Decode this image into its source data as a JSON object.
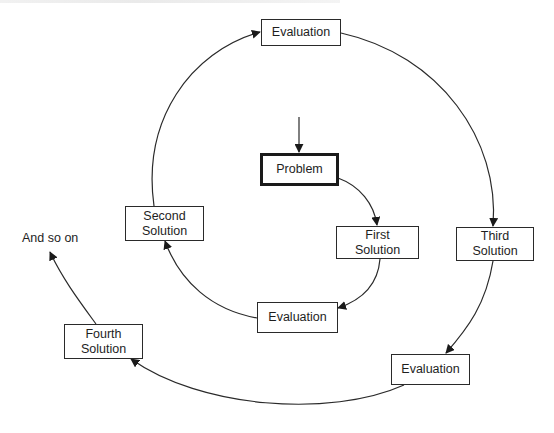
{
  "diagram": {
    "type": "spiral-flow",
    "nodes": [
      {
        "id": "problem",
        "label": "Problem",
        "emphasis": "thick-border"
      },
      {
        "id": "first_solution",
        "label": "First\nSolution",
        "line1": "First",
        "line2": "Solution"
      },
      {
        "id": "evaluation_1",
        "label": "Evaluation"
      },
      {
        "id": "second_solution",
        "label": "Second\nSolution",
        "line1": "Second",
        "line2": "Solution"
      },
      {
        "id": "evaluation_2",
        "label": "Evaluation"
      },
      {
        "id": "third_solution",
        "label": "Third\nSolution",
        "line1": "Third",
        "line2": "Solution"
      },
      {
        "id": "evaluation_3",
        "label": "Evaluation"
      },
      {
        "id": "fourth_solution",
        "label": "Fourth\nSolution",
        "line1": "Fourth",
        "line2": "Solution"
      }
    ],
    "continuation_label": "And so on",
    "edges": [
      [
        "entry",
        "problem"
      ],
      [
        "problem",
        "first_solution"
      ],
      [
        "first_solution",
        "evaluation_1"
      ],
      [
        "evaluation_1",
        "second_solution"
      ],
      [
        "second_solution",
        "evaluation_2"
      ],
      [
        "evaluation_2",
        "third_solution"
      ],
      [
        "third_solution",
        "evaluation_3"
      ],
      [
        "evaluation_3",
        "fourth_solution"
      ],
      [
        "fourth_solution",
        "and_so_on"
      ]
    ],
    "colors": {
      "line": "#2a2a2a",
      "background": "#ffffff"
    }
  }
}
